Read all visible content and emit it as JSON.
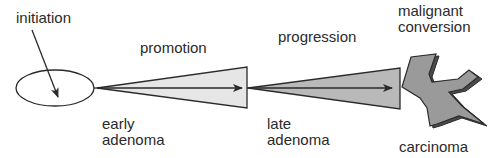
{
  "diagram": {
    "type": "progression-flow",
    "labels": {
      "initiation": "initiation",
      "promotion": "promotion",
      "progression": "progression",
      "malignant_line1": "malignant",
      "malignant_line2": "conversion",
      "early_line1": "early",
      "early_line2": "adenoma",
      "late_line1": "late",
      "late_line2": "adenoma",
      "carcinoma": "carcinoma"
    },
    "stages": [
      {
        "name": "initiation",
        "shape": "ellipse"
      },
      {
        "name": "early adenoma",
        "shape": "triangle",
        "fill": "#e6e6e6"
      },
      {
        "name": "late adenoma",
        "shape": "triangle",
        "fill": "#b9b9b9"
      },
      {
        "name": "carcinoma",
        "shape": "irregular-star",
        "fill": "#9a9a9a",
        "shadow": "#4a4a4a"
      }
    ],
    "colors": {
      "stroke": "#2a2a2a",
      "promotion_fill": "#e6e6e6",
      "progression_fill": "#b9b9b9",
      "carcinoma_fill": "#9a9a9a",
      "carcinoma_shadow": "#4a4a4a"
    }
  }
}
